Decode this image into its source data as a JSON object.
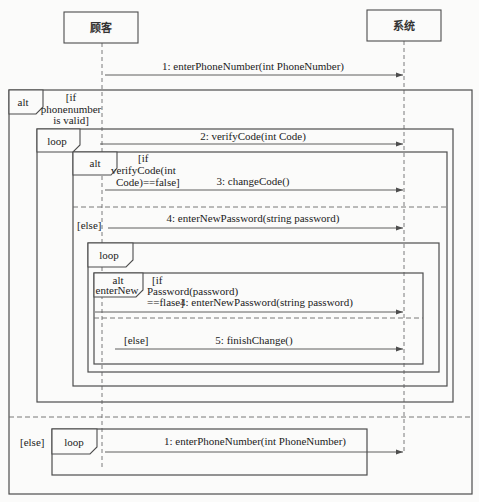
{
  "lifelines": [
    {
      "id": "customer",
      "label": "顾客"
    },
    {
      "id": "system",
      "label": "系统"
    }
  ],
  "messages": [
    {
      "label": "1: enterPhoneNumber(int PhoneNumber)",
      "from": "顾客",
      "to": "系统"
    },
    {
      "label": "2: verifyCode(int Code)",
      "from": "顾客",
      "to": "系统"
    },
    {
      "label": "3: changeCode()",
      "from": "顾客",
      "to": "系统"
    },
    {
      "label": "4: enterNewPassword(string password)",
      "from": "顾客",
      "to": "系统"
    },
    {
      "label": "4: enterNewPassword(string password)",
      "from": "顾客",
      "to": "系统"
    },
    {
      "label": "5: finishChange()",
      "from": "顾客",
      "to": "系统"
    },
    {
      "label": "1: enterPhoneNumber(int PhoneNumber)",
      "from": "顾客",
      "to": "系统"
    }
  ],
  "fragments": {
    "outer_alt": {
      "operator": "alt",
      "guard_lines": [
        "[if",
        "phonenumber",
        "is valid]"
      ],
      "else_label": "[else]"
    },
    "verify_loop": {
      "operator": "loop"
    },
    "verify_alt": {
      "operator": "alt",
      "guard_lines": [
        "[if",
        "verifyCode(int",
        "Code)==false]"
      ],
      "else_label": "[else]"
    },
    "password_loop": {
      "operator": "loop"
    },
    "password_alt": {
      "operator_lines": [
        "alt",
        "enterNew"
      ],
      "guard_lines": [
        "[if",
        "Password(password)",
        "==flase]"
      ],
      "else_label": "[else]"
    },
    "else_loop": {
      "operator": "loop"
    }
  }
}
